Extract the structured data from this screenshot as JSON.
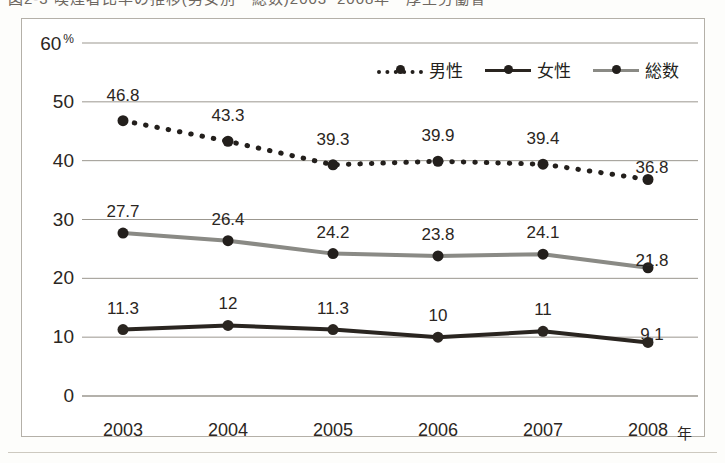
{
  "page": {
    "title_fragment": "図2-3 喫煙者比率の推移(男女別・総数)2003~2008年・厚生労働省",
    "background_color": "#fdfdfb"
  },
  "chart_data": {
    "type": "line",
    "title": "",
    "xlabel": "年",
    "ylabel": "%",
    "categories": [
      "2003",
      "2004",
      "2005",
      "2006",
      "2007",
      "2008"
    ],
    "ylim": [
      0,
      60
    ],
    "yticks": [
      0,
      10,
      20,
      30,
      40,
      50,
      60
    ],
    "ytick_labels": [
      "0",
      "10",
      "20",
      "30",
      "40",
      "50",
      "60"
    ],
    "y_unit": "%",
    "grid": true,
    "grid_axis": "y",
    "legend_position": "top-right",
    "series": [
      {
        "name": "男性",
        "values": [
          46.8,
          43.3,
          39.3,
          39.9,
          39.4,
          36.8
        ],
        "labels": [
          "46.8",
          "43.3",
          "39.3",
          "39.9",
          "39.4",
          "36.8"
        ],
        "color": "#231f1c",
        "style": "dotted",
        "marker": "circle"
      },
      {
        "name": "総数",
        "values": [
          27.7,
          26.4,
          24.2,
          23.8,
          24.1,
          21.8
        ],
        "labels": [
          "27.7",
          "26.4",
          "24.2",
          "23.8",
          "24.1",
          "21.8"
        ],
        "color": "#8a8a85",
        "style": "solid",
        "marker": "circle"
      },
      {
        "name": "女性",
        "values": [
          11.3,
          12,
          11.3,
          10,
          11,
          9.1
        ],
        "labels": [
          "11.3",
          "12",
          "11.3",
          "10",
          "11",
          "9.1"
        ],
        "color": "#2a2520",
        "style": "solid",
        "marker": "circle"
      }
    ]
  },
  "legend": {
    "items": [
      {
        "label": "男性",
        "style": "dotted",
        "color": "#231f1c"
      },
      {
        "label": "女性",
        "style": "solid-dark",
        "color": "#2a2520"
      },
      {
        "label": "総数",
        "style": "solid-gray",
        "color": "#8a8a85"
      }
    ]
  },
  "colors": {
    "frame": "#b4b0a8",
    "gridline": "#9b978f",
    "axis_text": "#2b2622",
    "male": "#231f1c",
    "female": "#2a2520",
    "total": "#8a8a85"
  }
}
